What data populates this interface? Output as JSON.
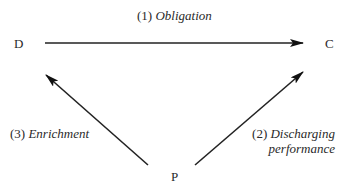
{
  "diagram": {
    "nodes": {
      "D": "D",
      "C": "C",
      "P": "P"
    },
    "edges": [
      {
        "from": "D",
        "to": "C",
        "number": "(1)",
        "label": "Obligation"
      },
      {
        "from": "P",
        "to": "C",
        "number": "(2)",
        "label_line1": "Discharging",
        "label_line2": "performance"
      },
      {
        "from": "P",
        "to": "D",
        "number": "(3)",
        "label": "Enrichment"
      }
    ]
  }
}
